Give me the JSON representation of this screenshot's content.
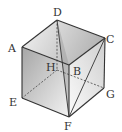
{
  "diagram": {
    "type": "cube",
    "vertices": {
      "A": {
        "label": "A",
        "x": 22,
        "y": 47
      },
      "B": {
        "label": "B",
        "x": 69,
        "y": 65
      },
      "C": {
        "label": "C",
        "x": 105,
        "y": 38
      },
      "D": {
        "label": "D",
        "x": 57,
        "y": 20
      },
      "E": {
        "label": "E",
        "x": 22,
        "y": 98
      },
      "F": {
        "label": "F",
        "x": 69,
        "y": 117
      },
      "G": {
        "label": "G",
        "x": 104,
        "y": 88
      },
      "H": {
        "label": "H",
        "x": 57,
        "y": 70
      }
    },
    "solid_edges": [
      "AD",
      "DC",
      "CB",
      "BA",
      "AE",
      "EF",
      "FG",
      "GC",
      "BF",
      "DF",
      "CF"
    ],
    "dashed_edges": [
      "DH",
      "HE",
      "HG"
    ],
    "colors": {
      "edge": "#333333",
      "top_face_light": "#f2f2f2",
      "top_face_dark": "#b8b8b8",
      "front_face_dark": "#a8a8a8",
      "front_face_light": "#f0f0f0",
      "right_face_light": "#fafafa",
      "right_face_dark": "#d0d0d0",
      "section": "#8c8c8c"
    }
  }
}
